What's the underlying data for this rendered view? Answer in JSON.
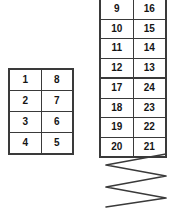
{
  "diagram": {
    "stroke_color": "#3a3a3a",
    "text_color": "#151515",
    "background": "#ffffff"
  },
  "left_table": {
    "name": "left-grid",
    "columns": 2,
    "rows": [
      [
        "1",
        "8"
      ],
      [
        "2",
        "7"
      ],
      [
        "3",
        "6"
      ],
      [
        "4",
        "5"
      ]
    ]
  },
  "right_table": {
    "name": "right-grid",
    "columns": 2,
    "rows": [
      [
        "9",
        "16"
      ],
      [
        "10",
        "15"
      ],
      [
        "11",
        "14"
      ],
      [
        "12",
        "13"
      ],
      [
        "17",
        "24"
      ],
      [
        "18",
        "23"
      ],
      [
        "19",
        "22"
      ],
      [
        "20",
        "21"
      ]
    ]
  },
  "zigzag": {
    "name": "serpentine-path",
    "vertex_count": 6,
    "points": "66,2 6,13 66,24 6,35 66,46 6,55"
  }
}
